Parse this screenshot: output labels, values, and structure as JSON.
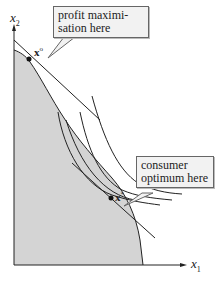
{
  "diagram": {
    "axes": {
      "y_label": "x",
      "y_label_sub": "2",
      "x_label": "x",
      "x_label_sub": "1"
    },
    "points": {
      "x_o": {
        "label": "x",
        "sup": "o"
      },
      "x_star": {
        "label": "x",
        "sup": "*"
      }
    },
    "callouts": {
      "profit": "profit maximi-\nsation here",
      "profit_line1": "profit maximi-",
      "profit_line2": "sation here",
      "consumer_line1": "consumer",
      "consumer_line2": "optimum here"
    },
    "colors": {
      "shade": "#d4d4d4",
      "line": "#222222",
      "callout_bg": "#f2f2f2"
    }
  }
}
